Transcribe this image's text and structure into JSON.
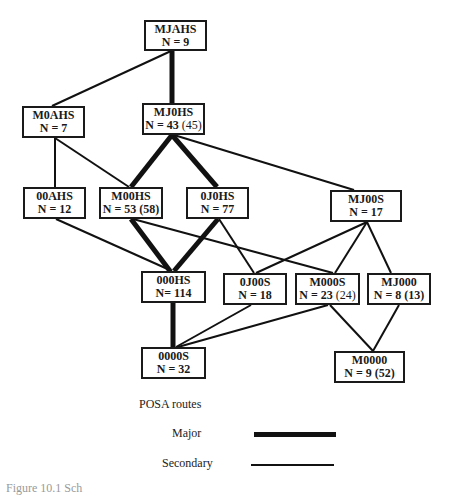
{
  "diagram": {
    "nodes": [
      {
        "id": "MJAHS",
        "label": "MJAHS",
        "n": "N = 9",
        "paren": "",
        "x": 144,
        "y": 20,
        "w": 63,
        "h": 31
      },
      {
        "id": "M0AHS",
        "label": "M0AHS",
        "n": "N = 7",
        "paren": "",
        "x": 22,
        "y": 106,
        "w": 63,
        "h": 32
      },
      {
        "id": "MJ0HS",
        "label": "MJ0HS",
        "n": "N = 43",
        "paren": " (45)",
        "x": 142,
        "y": 103,
        "w": 63,
        "h": 32
      },
      {
        "id": "00AHS",
        "label": "00AHS",
        "n": "N = 12",
        "paren": "",
        "x": 23,
        "y": 187,
        "w": 63,
        "h": 32
      },
      {
        "id": "M00HS",
        "label": "M00HS",
        "n": "N = 53 (58)",
        "paren": "",
        "x": 99,
        "y": 187,
        "w": 64,
        "h": 32
      },
      {
        "id": "0J0HS",
        "label": "0J0HS",
        "n": "N = 77",
        "paren": "",
        "x": 186,
        "y": 187,
        "w": 63,
        "h": 32
      },
      {
        "id": "MJ00S",
        "label": "MJ00S",
        "n": "N = 17",
        "paren": "",
        "x": 330,
        "y": 190,
        "w": 72,
        "h": 32
      },
      {
        "id": "000HS",
        "label": "000HS",
        "n": "N= 114",
        "paren": "",
        "x": 141,
        "y": 271,
        "w": 65,
        "h": 32
      },
      {
        "id": "0J00S",
        "label": "0J00S",
        "n": "N = 18",
        "paren": "",
        "x": 223,
        "y": 273,
        "w": 64,
        "h": 32
      },
      {
        "id": "M000S",
        "label": "M000S",
        "n": "N = 23",
        "paren": " (24)",
        "x": 295,
        "y": 273,
        "w": 65,
        "h": 32
      },
      {
        "id": "MJ000",
        "label": "MJ000",
        "n": "N = 8 (13)",
        "paren": "",
        "x": 367,
        "y": 273,
        "w": 64,
        "h": 32
      },
      {
        "id": "0000S",
        "label": "0000S",
        "n": "N = 32",
        "paren": "",
        "x": 141,
        "y": 347,
        "w": 65,
        "h": 32
      },
      {
        "id": "M0000",
        "label": "M0000",
        "n": "N = 9 (52)",
        "paren": "",
        "x": 334,
        "y": 351,
        "w": 71,
        "h": 32
      }
    ],
    "edges": [
      {
        "from": "MJAHS",
        "to": "M0AHS",
        "type": "secondary",
        "x1": 171,
        "y1": 51,
        "x2": 52,
        "y2": 106
      },
      {
        "from": "MJAHS",
        "to": "MJ0HS",
        "type": "major",
        "x1": 172,
        "y1": 51,
        "x2": 172,
        "y2": 103
      },
      {
        "from": "M0AHS",
        "to": "00AHS",
        "type": "secondary",
        "x1": 55,
        "y1": 138,
        "x2": 55,
        "y2": 187
      },
      {
        "from": "M0AHS",
        "to": "M00HS",
        "type": "secondary",
        "x1": 55,
        "y1": 138,
        "x2": 129,
        "y2": 187
      },
      {
        "from": "MJ0HS",
        "to": "M00HS",
        "type": "major",
        "x1": 172,
        "y1": 135,
        "x2": 131,
        "y2": 187
      },
      {
        "from": "MJ0HS",
        "to": "0J0HS",
        "type": "major",
        "x1": 172,
        "y1": 135,
        "x2": 217,
        "y2": 187
      },
      {
        "from": "MJ0HS",
        "to": "MJ00S",
        "type": "secondary",
        "x1": 174,
        "y1": 135,
        "x2": 354,
        "y2": 190
      },
      {
        "from": "00AHS",
        "to": "000HS",
        "type": "secondary",
        "x1": 56,
        "y1": 219,
        "x2": 172,
        "y2": 271
      },
      {
        "from": "M00HS",
        "to": "000HS",
        "type": "major",
        "x1": 131,
        "y1": 219,
        "x2": 170,
        "y2": 271
      },
      {
        "from": "M00HS",
        "to": "M000S",
        "type": "secondary",
        "x1": 133,
        "y1": 219,
        "x2": 333,
        "y2": 273
      },
      {
        "from": "0J0HS",
        "to": "000HS",
        "type": "major",
        "x1": 218,
        "y1": 219,
        "x2": 174,
        "y2": 271
      },
      {
        "from": "0J0HS",
        "to": "0J00S",
        "type": "secondary",
        "x1": 219,
        "y1": 219,
        "x2": 254,
        "y2": 273
      },
      {
        "from": "MJ00S",
        "to": "0J00S",
        "type": "secondary",
        "x1": 367,
        "y1": 222,
        "x2": 256,
        "y2": 273
      },
      {
        "from": "MJ00S",
        "to": "M000S",
        "type": "secondary",
        "x1": 367,
        "y1": 222,
        "x2": 335,
        "y2": 273
      },
      {
        "from": "MJ00S",
        "to": "MJ000",
        "type": "secondary",
        "x1": 367,
        "y1": 222,
        "x2": 391,
        "y2": 273
      },
      {
        "from": "000HS",
        "to": "0000S",
        "type": "major",
        "x1": 173,
        "y1": 303,
        "x2": 173,
        "y2": 347
      },
      {
        "from": "0J00S",
        "to": "0000S",
        "type": "secondary",
        "x1": 251,
        "y1": 305,
        "x2": 176,
        "y2": 347
      },
      {
        "from": "M000S",
        "to": "0000S",
        "type": "secondary",
        "x1": 328,
        "y1": 305,
        "x2": 178,
        "y2": 347
      },
      {
        "from": "M000S",
        "to": "M0000",
        "type": "secondary",
        "x1": 330,
        "y1": 305,
        "x2": 373,
        "y2": 351
      },
      {
        "from": "MJ000",
        "to": "M0000",
        "type": "secondary",
        "x1": 399,
        "y1": 305,
        "x2": 373,
        "y2": 351
      }
    ],
    "stroke_widths": {
      "major": 5,
      "secondary": 2
    },
    "stroke_color": "#111111"
  },
  "legend": {
    "title": "POSA routes",
    "items": [
      {
        "label": "Major",
        "type": "major"
      },
      {
        "label": "Secondary",
        "type": "secondary"
      }
    ]
  },
  "caption": "Figure 10.1 Sch"
}
